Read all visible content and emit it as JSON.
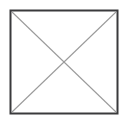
{
  "canvas": {
    "width": 128,
    "height": 124,
    "background_color": "#ffffff",
    "alt_text": "broken image placeholder"
  },
  "graphic": {
    "name": "missing-image-placeholder",
    "description": "Square outline with two crossing diagonals forming an X",
    "frame": {
      "x": 10.5,
      "y": 10.5,
      "width": 107,
      "height": 103,
      "stroke_color": "#3a3a3c",
      "stroke_width": 2,
      "fill_color": "#ffffff"
    },
    "diagonals": {
      "stroke_color": "#9b9b9b",
      "stroke_width": 1.1,
      "lines": [
        {
          "name": "diagonal-top-left-to-bottom-right",
          "x1": 12,
          "y1": 12,
          "x2": 116,
          "y2": 112
        },
        {
          "name": "diagonal-bottom-left-to-top-right",
          "x1": 12,
          "y1": 112,
          "x2": 116,
          "y2": 12
        }
      ],
      "intersection": {
        "x": 64,
        "y": 62
      }
    }
  }
}
